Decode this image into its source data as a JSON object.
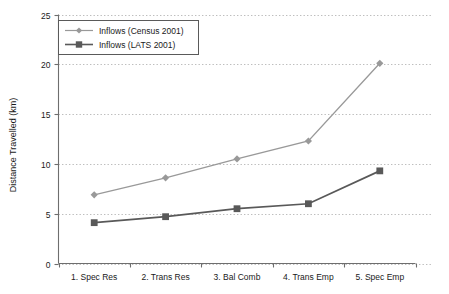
{
  "chart_data": {
    "type": "line",
    "title": "",
    "xlabel": "",
    "ylabel": "Distance Travelled (km)",
    "categories": [
      "1. Spec Res",
      "2. Trans Res",
      "3. Bal Comb",
      "4. Trans Emp",
      "5. Spec Emp"
    ],
    "ylim": [
      0,
      25
    ],
    "yticks": [
      0,
      5,
      10,
      15,
      20,
      25
    ],
    "ytick_labels": [
      "0",
      "5",
      "10",
      "15",
      "20",
      "25"
    ],
    "grid": "horizontal-dotted",
    "legend_position": "top-left",
    "series": [
      {
        "name": "Inflows (Census 2001)",
        "values": [
          6.9,
          8.6,
          10.5,
          12.3,
          20.1
        ],
        "color": "#999999",
        "marker": "diamond"
      },
      {
        "name": "Inflows (LATS 2001)",
        "values": [
          4.1,
          4.7,
          5.5,
          6.0,
          9.3
        ],
        "color": "#595959",
        "marker": "square"
      }
    ]
  },
  "legend": {
    "entries": [
      {
        "label": "Inflows (Census 2001)"
      },
      {
        "label": "Inflows (LATS 2001)"
      }
    ]
  },
  "axes": {
    "y_title": "Distance Travelled (km)",
    "y_ticks": [
      "0",
      "5",
      "10",
      "15",
      "20",
      "25"
    ],
    "x_ticks": [
      "1. Spec Res",
      "2. Trans Res",
      "3. Bal Comb",
      "4. Trans Emp",
      "5. Spec Emp"
    ]
  },
  "colors": {
    "census": "#999999",
    "lats": "#595959",
    "axis": "#6e6e6e",
    "grid": "#bdbdbd",
    "text": "#1a1a1a",
    "background": "#ffffff"
  }
}
